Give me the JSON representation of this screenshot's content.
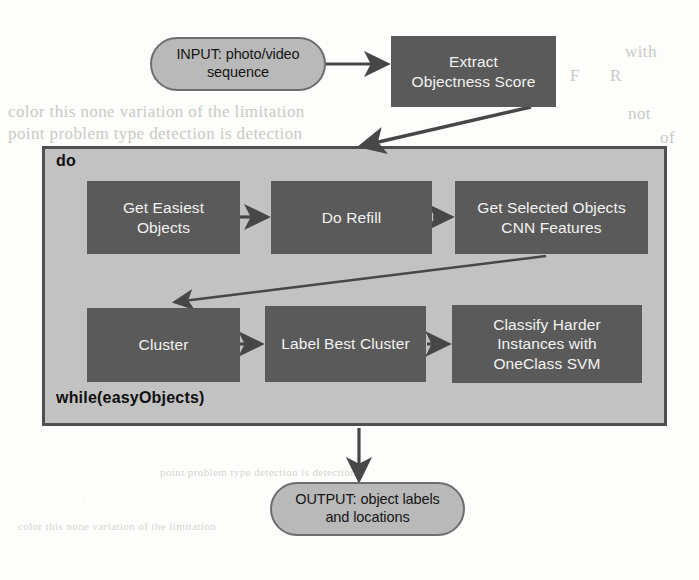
{
  "diagram": {
    "colors": {
      "page_background": "#fdfdfc",
      "terminal_fill": "#b9b9b9",
      "terminal_border": "#6d6d6d",
      "process_fill": "#5a5a5a",
      "process_text": "#f2f2f2",
      "loop_fill": "#c2c2c2",
      "loop_border": "#4f4f4f",
      "edge_color": "#474747"
    },
    "nodes": {
      "input": {
        "shape": "stadium",
        "label": "INPUT: photo/video sequence",
        "line1": "INPUT: photo/video",
        "line2": "sequence"
      },
      "extract": {
        "shape": "rectangle",
        "label": "Extract Objectness Score",
        "line1": "Extract",
        "line2": "Objectness Score"
      },
      "get_easiest": {
        "shape": "rectangle",
        "label": "Get Easiest Objects",
        "line1": "Get Easiest",
        "line2": "Objects"
      },
      "do_refill": {
        "shape": "rectangle",
        "label": "Do Refill",
        "line1": "Do Refill",
        "line2": ""
      },
      "cnn_features": {
        "shape": "rectangle",
        "label": "Get Selected Objects CNN Features",
        "line1": "Get Selected Objects",
        "line2": "CNN Features"
      },
      "cluster": {
        "shape": "rectangle",
        "label": "Cluster",
        "line1": "Cluster",
        "line2": ""
      },
      "label_best": {
        "shape": "rectangle",
        "label": "Label Best Cluster",
        "line1": "Label Best Cluster",
        "line2": ""
      },
      "classify": {
        "shape": "rectangle",
        "label": "Classify Harder Instances with OneClass SVM",
        "line1": "Classify Harder",
        "line2": "Instances with",
        "line3": "OneClass SVM"
      },
      "output": {
        "shape": "stadium",
        "label": "OUTPUT: object labels and locations",
        "line1": "OUTPUT: object labels",
        "line2": "and locations"
      }
    },
    "loop": {
      "start_keyword": "do",
      "end_keyword": "while(easyObjects)"
    },
    "edges": [
      {
        "from": "input",
        "to": "extract",
        "style": "straight"
      },
      {
        "from": "extract",
        "to": "loop",
        "style": "diagonal"
      },
      {
        "from": "get_easiest",
        "to": "do_refill",
        "style": "straight"
      },
      {
        "from": "do_refill",
        "to": "cnn_features",
        "style": "straight"
      },
      {
        "from": "cnn_features",
        "to": "cluster",
        "style": "diagonal-feedback"
      },
      {
        "from": "cluster",
        "to": "label_best",
        "style": "straight"
      },
      {
        "from": "label_best",
        "to": "classify",
        "style": "straight"
      },
      {
        "from": "loop",
        "to": "output",
        "style": "straight"
      }
    ]
  },
  "bleed_text": {
    "t1": "the",
    "t2": "A",
    "t3": "with",
    "t4": "F",
    "t5": "R",
    "t6": "color this none variation of the limitation",
    "t7": "point problem type detection is detection",
    "t8": "not",
    "t9": "of"
  }
}
